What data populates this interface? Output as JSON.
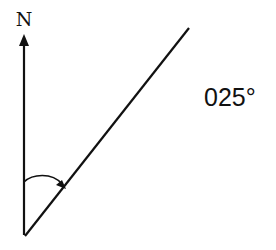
{
  "diagram": {
    "type": "bearing",
    "north_label": "N",
    "bearing_label": "025°",
    "bearing_degrees": 25,
    "line_color": "#111111",
    "background": "#ffffff"
  }
}
